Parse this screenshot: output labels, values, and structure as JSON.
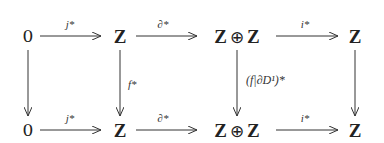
{
  "diagram": {
    "type": "commutative-diagram",
    "top_row": {
      "nodes": [
        "0",
        "Z",
        "Z ⊕ Z",
        "Z"
      ],
      "arrows": [
        "j*",
        "∂*",
        "i*"
      ]
    },
    "bottom_row": {
      "nodes": [
        "0",
        "Z",
        "Z ⊕ Z",
        "Z"
      ],
      "arrows": [
        "j*",
        "∂*",
        "i*"
      ]
    },
    "vertical_arrows": [
      "",
      "f*",
      "(f|∂D¹)*",
      ""
    ],
    "labels": {
      "j": "j",
      "d": "∂",
      "i": "i",
      "star": "*",
      "f_star": "f",
      "restrict": "(f|∂D",
      "sup": "1",
      "close": ")"
    },
    "symbols": {
      "Z": "Z",
      "oplus": "⊕",
      "zero": "0"
    },
    "colors": {
      "ink": "#222222",
      "background": "#ffffff"
    }
  }
}
